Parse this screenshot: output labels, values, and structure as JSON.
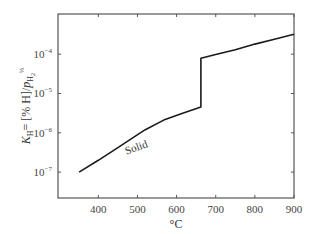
{
  "chart_data": {
    "type": "line",
    "title": "",
    "xlabel": "°C",
    "ylabel": "K_H = [% H]/p_H2^1/2",
    "ylabel_parts": {
      "main": "K",
      "sub": "H",
      "mid": "= [% H]/",
      "p": "p",
      "psub": "H",
      "psub2": "2",
      "sup": "½"
    },
    "yscale": "log",
    "xlim": [
      297,
      900
    ],
    "ylim": [
      2.2e-08,
      0.00105
    ],
    "grid": false,
    "legend": null,
    "x_ticks": [
      400,
      500,
      600,
      700,
      800,
      900
    ],
    "x_tick_labels": [
      "400",
      "500",
      "600",
      "700",
      "800",
      "900"
    ],
    "y_ticks": [
      1e-07,
      1e-06,
      1e-05,
      0.0001
    ],
    "y_tick_labels": [
      {
        "base": "10",
        "exp": "−7"
      },
      {
        "base": "10",
        "exp": "−6"
      },
      {
        "base": "10",
        "exp": "−5"
      },
      {
        "base": "10",
        "exp": "−4"
      }
    ],
    "series": [
      {
        "name": "K_H",
        "x": [
          351,
          400,
          450,
          482,
          520,
          567,
          610,
          662,
          662,
          700,
          750,
          800,
          850,
          900
        ],
        "values": [
          1e-07,
          2e-07,
          4.2e-07,
          6.8e-07,
          1.2e-06,
          2.1e-06,
          3e-06,
          4.5e-06,
          7.9e-05,
          9.8e-05,
          0.00013,
          0.00018,
          0.00024,
          0.00032
        ]
      }
    ],
    "annotations": [
      {
        "text": "Solid",
        "x": 500,
        "y": 3.5e-07,
        "rotation": -20
      }
    ]
  }
}
